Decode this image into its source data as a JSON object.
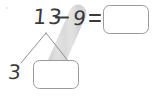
{
  "page": {
    "background_color": "#ffffff",
    "width": 156,
    "height": 98
  },
  "equation": {
    "minuend": "13",
    "operator": "−",
    "subtrahend": "9",
    "equals": "=",
    "answer_box_value": "",
    "answer_box_placeholder": ""
  },
  "number_bond": {
    "whole": "13",
    "part_known": "3",
    "part_missing_value": "",
    "part_missing_placeholder": ""
  },
  "highlight": {
    "name": "highlighter-stroke",
    "color": "#dcdcdc",
    "from": "subtrahend-9",
    "to": "number-bond-missing-part-box"
  },
  "ink": {
    "pencil_color": "#3a3a3a",
    "box_outline_color": "#9a9a9a",
    "bond_line_color": "#8f8f8f"
  }
}
